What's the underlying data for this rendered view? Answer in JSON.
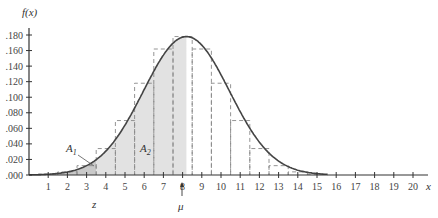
{
  "chart_data": {
    "type": "line",
    "title": "",
    "xlabel": "x",
    "ylabel": "f(x)",
    "xlim": [
      0,
      21
    ],
    "ylim": [
      0,
      0.19
    ],
    "grid": false,
    "x_ticks": [
      "1",
      "2",
      "3",
      "4",
      "5",
      "6",
      "7",
      "8",
      "9",
      "10",
      "11",
      "12",
      "13",
      "14",
      "15",
      "16",
      "17",
      "18",
      "19",
      "20"
    ],
    "y_ticks": [
      ".000",
      ".020",
      ".040",
      ".060",
      ".080",
      ".100",
      ".120",
      ".140",
      ".160",
      ".180"
    ],
    "curve": {
      "name": "normal density",
      "mean": 8.2,
      "sd": 2.24,
      "peak": 0.178
    },
    "series": [
      {
        "name": "probability bars (dashed)",
        "x": [
          1,
          2,
          3,
          4,
          5,
          6,
          7,
          8,
          9,
          10,
          11,
          12,
          13,
          14,
          15
        ],
        "values": [
          0.001,
          0.004,
          0.012,
          0.034,
          0.07,
          0.118,
          0.162,
          0.178,
          0.162,
          0.118,
          0.07,
          0.034,
          0.012,
          0.004,
          0.001
        ]
      }
    ],
    "shaded_regions": [
      {
        "label": "A1",
        "from": 0,
        "to": 3.5,
        "shade": "#c9c9c9"
      },
      {
        "label": "A2",
        "from": 3.5,
        "to": 8.2,
        "shade": "#e2e2e2"
      }
    ],
    "annotations": [
      {
        "text": "A1",
        "x": 2.8,
        "y": 0.022
      },
      {
        "text": "A2",
        "x": 5.4,
        "y": 0.022
      },
      {
        "text": "z",
        "x": 3.5,
        "position": "below-axis"
      },
      {
        "text": "μ",
        "x": 8.2,
        "position": "below-axis",
        "arrow": true
      }
    ]
  },
  "labels": {
    "y_axis_title": "f(x)",
    "x_axis_title": "x",
    "a1_main": "A",
    "a1_sub": "1",
    "a2_main": "A",
    "a2_sub": "2",
    "z_label": "z",
    "mu_label": "μ"
  }
}
